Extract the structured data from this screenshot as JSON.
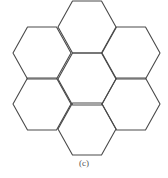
{
  "figure": {
    "caption": "(c)",
    "stroke_color": "#4a4a4a",
    "background": "#ffffff",
    "hexagons": [
      {
        "name": "center",
        "cx": 87,
        "cy": 79
      },
      {
        "name": "top",
        "cx": 87,
        "cy": 27
      },
      {
        "name": "upper-left",
        "cx": 42,
        "cy": 53
      },
      {
        "name": "upper-right",
        "cx": 131,
        "cy": 53
      },
      {
        "name": "lower-left",
        "cx": 42,
        "cy": 104
      },
      {
        "name": "lower-right",
        "cx": 131,
        "cy": 104
      },
      {
        "name": "bottom",
        "cx": 87,
        "cy": 129
      }
    ],
    "hex_radius": 29
  }
}
